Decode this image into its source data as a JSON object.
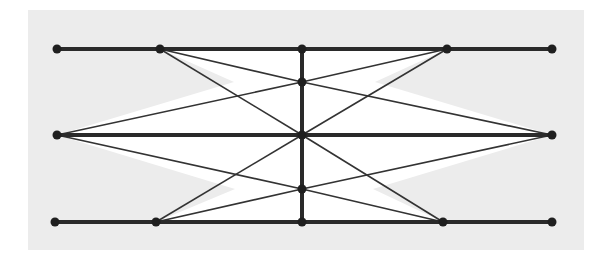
{
  "diagram": {
    "title": "",
    "colors": {
      "panel": "#ececec",
      "interior": "#ffffff",
      "thick_line": "#2a2a2a",
      "thin_line": "#333333",
      "node": "#1f1f1f"
    },
    "rows": [
      "top",
      "middle",
      "bottom"
    ],
    "nodes": [
      {
        "id": "top-left-end",
        "row": "top",
        "col": "left-end"
      },
      {
        "id": "top-inner-left",
        "row": "top",
        "col": "inner-left"
      },
      {
        "id": "top-center",
        "row": "top",
        "col": "center"
      },
      {
        "id": "top-inner-right",
        "row": "top",
        "col": "inner-right"
      },
      {
        "id": "top-right-end",
        "row": "top",
        "col": "right-end"
      },
      {
        "id": "mid-left",
        "row": "middle",
        "col": "left-end"
      },
      {
        "id": "mid-center",
        "row": "middle",
        "col": "center"
      },
      {
        "id": "mid-right",
        "row": "middle",
        "col": "right-end"
      },
      {
        "id": "upper-center",
        "row": "upper-between",
        "col": "center"
      },
      {
        "id": "lower-center",
        "row": "lower-between",
        "col": "center"
      },
      {
        "id": "bot-left-end",
        "row": "bottom",
        "col": "left-end"
      },
      {
        "id": "bot-inner-left",
        "row": "bottom",
        "col": "inner-left"
      },
      {
        "id": "bot-center",
        "row": "bottom",
        "col": "center"
      },
      {
        "id": "bot-inner-right",
        "row": "bottom",
        "col": "inner-right"
      },
      {
        "id": "bot-right-end",
        "row": "bottom",
        "col": "right-end"
      }
    ],
    "thick_edges": [
      [
        "top-left-end",
        "top-right-end"
      ],
      [
        "mid-left",
        "mid-right"
      ],
      [
        "bot-left-end",
        "bot-right-end"
      ],
      [
        "top-center",
        "bot-center"
      ]
    ],
    "thin_edges": [
      [
        "top-inner-left",
        "upper-center"
      ],
      [
        "top-inner-left",
        "mid-center"
      ],
      [
        "top-inner-right",
        "upper-center"
      ],
      [
        "top-inner-right",
        "mid-center"
      ],
      [
        "mid-left",
        "upper-center"
      ],
      [
        "mid-left",
        "lower-center"
      ],
      [
        "mid-right",
        "upper-center"
      ],
      [
        "mid-right",
        "lower-center"
      ],
      [
        "bot-inner-left",
        "mid-center"
      ],
      [
        "bot-inner-left",
        "lower-center"
      ],
      [
        "bot-inner-right",
        "mid-center"
      ],
      [
        "bot-inner-right",
        "lower-center"
      ]
    ]
  }
}
